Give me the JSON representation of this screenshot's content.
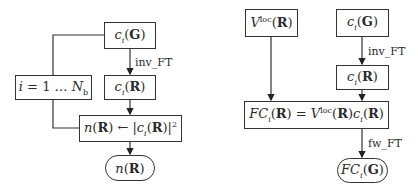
{
  "left_diagram": {
    "boxes": {
      "ci_G": {
        "label": "c_i(G)"
      },
      "loop": {
        "label": "i = 1 … N_b"
      },
      "ci_R": {
        "label": "c_i(R)"
      },
      "density": {
        "label": "n(R) ← |c_i(R)|^2"
      },
      "output": {
        "label": "n(R)"
      }
    },
    "edge_labels": {
      "inv_ft": "inv_FT"
    }
  },
  "right_diagram": {
    "boxes": {
      "vloc": {
        "label": "V^loc(R)"
      },
      "ci_G": {
        "label": "c_i(G)"
      },
      "ci_R": {
        "label": "c_i(R)"
      },
      "product": {
        "label": "FC_i(R) = V^loc(R) c_i(R)"
      },
      "output": {
        "label": "FC_i(G)"
      }
    },
    "edge_labels": {
      "inv_ft": "inv_FT",
      "fw_ft": "fw_FT"
    }
  }
}
